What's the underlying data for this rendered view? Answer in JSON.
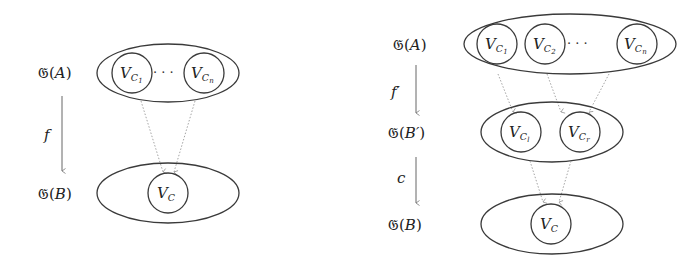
{
  "left_diagram": {
    "top_label": {
      "prefix": "𝔊(",
      "var": "A",
      "suffix": ")"
    },
    "bottom_label": {
      "prefix": "𝔊(",
      "var": "B",
      "suffix": ")"
    },
    "arrow_label": "f",
    "top_nodes": [
      {
        "base": "V",
        "sub": "C",
        "subsub": "1"
      },
      {
        "base": "V",
        "sub": "C",
        "subsub": "n"
      }
    ],
    "ellipsis": "· · ·",
    "bottom_node": {
      "base": "V",
      "sub": "C"
    }
  },
  "right_diagram": {
    "top_label": {
      "prefix": "𝔊(",
      "var": "A",
      "suffix": ")"
    },
    "middle_label": {
      "prefix": "𝔊(",
      "var": "B′",
      "suffix": ")"
    },
    "bottom_label": {
      "prefix": "𝔊(",
      "var": "B",
      "suffix": ")"
    },
    "arrow1_label": "f′",
    "arrow2_label": "c",
    "top_nodes": [
      {
        "base": "V",
        "sub": "C",
        "subsub": "1"
      },
      {
        "base": "V",
        "sub": "C",
        "subsub": "2"
      },
      {
        "base": "V",
        "sub": "C",
        "subsub": "n"
      }
    ],
    "ellipsis": "· · ·",
    "middle_nodes": [
      {
        "base": "V",
        "sub": "C",
        "subsub": "l"
      },
      {
        "base": "V",
        "sub": "C",
        "subsub": "r"
      }
    ],
    "bottom_node": {
      "base": "V",
      "sub": "C"
    }
  },
  "colors": {
    "stroke": "#3a3a3a",
    "dotted": "#9a9a9a",
    "text": "#222222"
  }
}
